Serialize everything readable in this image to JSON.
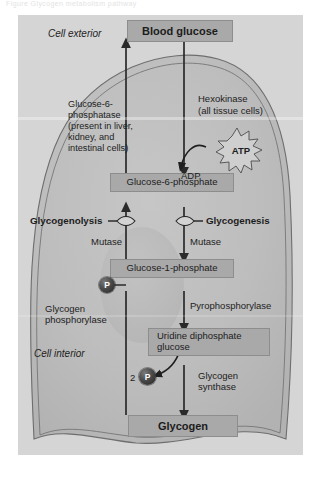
{
  "page": {
    "top_caption": "Figure  Glycogen metabolism pathway",
    "background_color": "#ffffff",
    "panel_color": "#d5d5d5",
    "box_color": "#a9a9a9",
    "line_color": "#2a2a2a"
  },
  "diagram": {
    "title": "Glycogen metabolism",
    "type": "biochemical-pathway",
    "regions": {
      "exterior_label": "Cell exterior",
      "interior_label": "Cell interior"
    },
    "nodes": [
      {
        "id": "blood-glucose",
        "label": "Blood glucose",
        "bold": true
      },
      {
        "id": "glucose-6-phosphate",
        "label": "Glucose-6-phosphate",
        "bold": false
      },
      {
        "id": "glucose-1-phosphate",
        "label": "Glucose-1-phosphate",
        "bold": false
      },
      {
        "id": "udp-glucose",
        "label": "Uridine diphosphate\nglucose",
        "bold": false
      },
      {
        "id": "glycogen",
        "label": "Glycogen",
        "bold": true
      }
    ],
    "enzymes": {
      "hexokinase": "Hexokinase",
      "hexokinase_note": "(all tissue cells)",
      "glucose_6_phosphatase": "Glucose-6-\nphosphatase\n(present in liver,\nkidney, and\nintestinal cells)",
      "mutase_left": "Mutase",
      "mutase_right": "Mutase",
      "glycogen_phosphorylase": "Glycogen\nphosphorylase",
      "pyrophosphorylase": "Pyrophosphorylase",
      "glycogen_synthase": "Glycogen\nsynthase"
    },
    "pathways": {
      "glycogenolysis": "Glycogenolysis",
      "glycogenesis": "Glycogenesis"
    },
    "metabolites": {
      "atp": "ATP",
      "adp": "ADP",
      "phosphate_symbol": "P",
      "phosphate_count": "2"
    }
  }
}
